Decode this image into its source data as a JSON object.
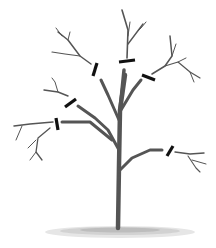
{
  "illustration": {
    "subject": "tree-pruning-diagram",
    "cut_marks_count": 6,
    "colors": {
      "branch": "#555555",
      "cut_mark": "#111111",
      "ground": "#9a9a9a",
      "background": "#ffffff"
    }
  }
}
